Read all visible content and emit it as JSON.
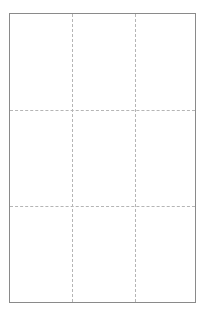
{
  "grid": {
    "rows": 3,
    "columns": 3,
    "border_color": "#8a8a8a",
    "divider_color": "#b5b5b5",
    "divider_style": "dashed",
    "vertical_dividers_x": [
      62,
      125
    ],
    "horizontal_dividers_y": [
      96,
      192
    ],
    "cells": [
      {
        "row": 1,
        "col": 1,
        "label": ""
      },
      {
        "row": 1,
        "col": 2,
        "label": ""
      },
      {
        "row": 1,
        "col": 3,
        "label": ""
      },
      {
        "row": 2,
        "col": 1,
        "label": ""
      },
      {
        "row": 2,
        "col": 2,
        "label": ""
      },
      {
        "row": 2,
        "col": 3,
        "label": ""
      },
      {
        "row": 3,
        "col": 1,
        "label": ""
      },
      {
        "row": 3,
        "col": 2,
        "label": ""
      },
      {
        "row": 3,
        "col": 3,
        "label": ""
      }
    ]
  }
}
